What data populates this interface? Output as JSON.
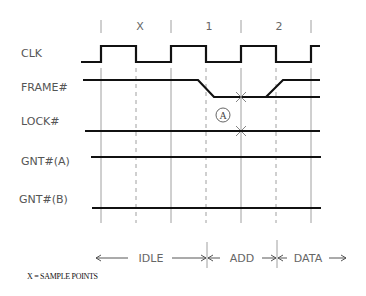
{
  "diagram": {
    "type": "timing-diagram",
    "cycle_labels": [
      "X",
      "1",
      "2"
    ],
    "signals": [
      {
        "name": "CLK"
      },
      {
        "name": "FRAME#"
      },
      {
        "name": "LOCK#"
      },
      {
        "name": "GNT#(A)"
      },
      {
        "name": "GNT#(B)"
      }
    ],
    "annotation": "A",
    "phases": [
      {
        "label": "IDLE"
      },
      {
        "label": "ADD"
      },
      {
        "label": "DATA"
      }
    ],
    "footnote": "X = SAMPLE POINTS",
    "colors": {
      "waveform": "#111111",
      "grid": "#888888",
      "text": "#555555"
    }
  }
}
